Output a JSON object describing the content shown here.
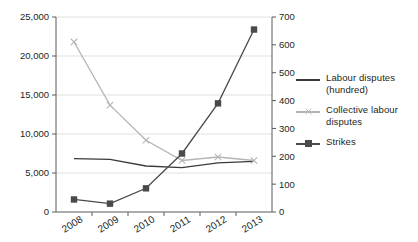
{
  "chart_data": {
    "type": "line",
    "title": "",
    "subtitle": "",
    "xlabel": "",
    "ylabel": "",
    "grid": true,
    "legend_position": "right",
    "categories": [
      "2008",
      "2009",
      "2010",
      "2011",
      "2012",
      "2013"
    ],
    "axes": {
      "left": {
        "min": 0,
        "max": 25000,
        "step": 5000,
        "ticks": [
          "0",
          "5,000",
          "10,000",
          "15,000",
          "20,000",
          "25,000"
        ],
        "tick_values": [
          0,
          5000,
          10000,
          15000,
          20000,
          25000
        ]
      },
      "right": {
        "min": 0,
        "max": 700,
        "step": 100,
        "ticks": [
          "0",
          "100",
          "200",
          "300",
          "400",
          "500",
          "600",
          "700"
        ],
        "tick_values": [
          0,
          100,
          200,
          300,
          400,
          500,
          600,
          700
        ]
      }
    },
    "series": [
      {
        "name": "Labour disputes (hundred)",
        "axis": "left",
        "color": "#3a3a3a",
        "marker": "none",
        "values": [
          6850,
          6750,
          5900,
          5700,
          6300,
          6500
        ]
      },
      {
        "name": "Collective labour disputes",
        "axis": "left",
        "color": "#b5b5b5",
        "marker": "x",
        "values": [
          21800,
          13700,
          9200,
          6600,
          7050,
          6600
        ]
      },
      {
        "name": "Strikes",
        "axis": "right",
        "color": "#4a4a4a",
        "marker": "square",
        "values": [
          45,
          30,
          85,
          210,
          390,
          655
        ]
      }
    ]
  },
  "legend": {
    "items": [
      {
        "label": "Labour disputes (hundred)",
        "color": "#3a3a3a",
        "marker": "none"
      },
      {
        "label": "Collective labour disputes",
        "color": "#b5b5b5",
        "marker": "x"
      },
      {
        "label": "Strikes",
        "color": "#4a4a4a",
        "marker": "square"
      }
    ]
  }
}
